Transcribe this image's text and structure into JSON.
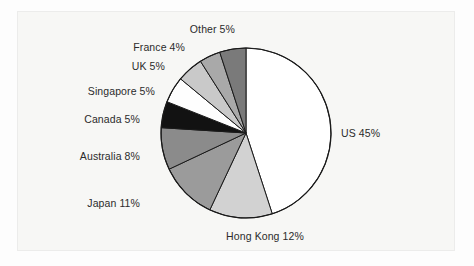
{
  "figure": {
    "background_color": "#fdfdfd",
    "panel_color": "#f7f7f5",
    "panel_border_color": "#ececeb"
  },
  "chart_data": {
    "type": "pie",
    "title": "",
    "subtitle": "",
    "xlabel": "",
    "ylabel": "",
    "legend_position": "none",
    "grid": false,
    "start_angle_deg": 0,
    "direction": "clockwise",
    "value_unit": "percent",
    "total": 100,
    "categories": [
      "US",
      "Hong Kong",
      "Japan",
      "Australia",
      "Canada",
      "Singapore",
      "UK",
      "France",
      "Other"
    ],
    "values": [
      45,
      12,
      11,
      8,
      5,
      5,
      5,
      4,
      5
    ],
    "labels": [
      "US 45%",
      "Hong Kong 12%",
      "Japan 11%",
      "Australia 8%",
      "Canada 5%",
      "Singapore 5%",
      "UK 5%",
      "France 4%",
      "Other 5%"
    ],
    "slice_colors": [
      "#ffffff",
      "#d2d2d2",
      "#9b9b9b",
      "#8b8b8b",
      "#121212",
      "#fefefe",
      "#c9c9c9",
      "#a9a9a9",
      "#7a7a7a"
    ],
    "slice_outline_color": "#1a1a1a",
    "label_color": "#2b2b2b",
    "slices": [
      {
        "name": "US",
        "label": "US 45%",
        "value": 45,
        "color": "#ffffff"
      },
      {
        "name": "Hong Kong",
        "label": "Hong Kong 12%",
        "value": 12,
        "color": "#d2d2d2"
      },
      {
        "name": "Japan",
        "label": "Japan 11%",
        "value": 11,
        "color": "#9b9b9b"
      },
      {
        "name": "Australia",
        "label": "Australia 8%",
        "value": 8,
        "color": "#8b8b8b"
      },
      {
        "name": "Canada",
        "label": "Canada 5%",
        "value": 5,
        "color": "#121212"
      },
      {
        "name": "Singapore",
        "label": "Singapore 5%",
        "value": 5,
        "color": "#fefefe"
      },
      {
        "name": "UK",
        "label": "UK 5%",
        "value": 5,
        "color": "#c9c9c9"
      },
      {
        "name": "France",
        "label": "France 4%",
        "value": 4,
        "color": "#a9a9a9"
      },
      {
        "name": "Other",
        "label": "Other 5%",
        "value": 5,
        "color": "#7a7a7a"
      }
    ],
    "geometry": {
      "center_x": 246,
      "center_y": 133,
      "radius": 85
    }
  }
}
